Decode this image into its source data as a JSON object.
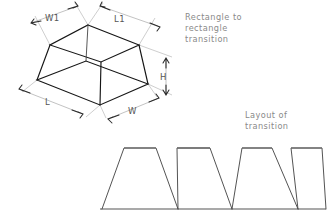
{
  "drawing": {
    "background_color": "#ffffff",
    "line_color": "#161616",
    "dimension_color": "#a8a8a8",
    "label_color": "#555555",
    "note_color": "#8a8a8a"
  },
  "notes": {
    "top_note_line1": "Rectangle to",
    "top_note_line2": "rectangle",
    "top_note_line3": "transition",
    "bottom_note_line1": "Layout of",
    "bottom_note_line2": "transition"
  },
  "dimensions": [
    {
      "id": "w1",
      "label": "W1",
      "describes": "top-face-width"
    },
    {
      "id": "l1",
      "label": "L1",
      "describes": "top-face-length"
    },
    {
      "id": "l",
      "label": "L",
      "describes": "bottom-face-length"
    },
    {
      "id": "w",
      "label": "W",
      "describes": "bottom-face-width"
    },
    {
      "id": "h",
      "label": "H",
      "describes": "vertical-height"
    }
  ],
  "isometric": {
    "top_face": [
      [
        88,
        25
      ],
      [
        139,
        45
      ],
      [
        101,
        62
      ],
      [
        50,
        45
      ]
    ],
    "bottom_face": [
      [
        37,
        80
      ],
      [
        100,
        105
      ],
      [
        148,
        84
      ],
      [
        86,
        61
      ]
    ],
    "corner_links": [
      [
        [
          88,
          25
        ],
        [
          86,
          61
        ]
      ],
      [
        [
          139,
          45
        ],
        [
          148,
          84
        ]
      ],
      [
        [
          50,
          45
        ],
        [
          37,
          80
        ]
      ],
      [
        [
          101,
          62
        ],
        [
          100,
          105
        ]
      ]
    ],
    "vertical_edge": [
      [
        100,
        105
      ],
      [
        101,
        62
      ]
    ]
  },
  "layout": {
    "baseline_y": 209,
    "top_y": 148,
    "baseline_start_x": 100,
    "baseline_end_x": 326,
    "trapezoids": [
      {
        "base_left": 102,
        "base_right": 178,
        "top_left": 124,
        "top_right": 156
      },
      {
        "base_left": 178,
        "base_right": 232,
        "top_left": 177,
        "top_right": 210
      },
      {
        "base_left": 232,
        "base_right": 298,
        "top_left": 242,
        "top_right": 272
      },
      {
        "base_left": 298,
        "base_right": 326,
        "top_left": 291,
        "top_right": 322
      }
    ]
  }
}
